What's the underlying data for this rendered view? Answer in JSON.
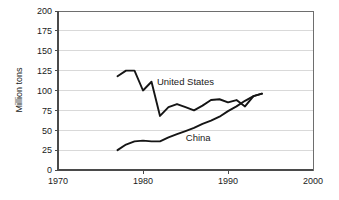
{
  "chart_data": {
    "type": "line",
    "title": "",
    "subtitle": "",
    "xlabel": "",
    "ylabel": "Million tons",
    "xlim": [
      1970,
      2000
    ],
    "ylim": [
      0,
      200
    ],
    "xticks": [
      "1970",
      "1980",
      "1990",
      "2000"
    ],
    "yticks": [
      "0",
      "25",
      "50",
      "75",
      "100",
      "125",
      "150",
      "175",
      "200"
    ],
    "grid": "horizontal",
    "legend_position": "inline-annotations",
    "annotations": [
      {
        "text": "United States",
        "x": 1985.0,
        "y": 107
      },
      {
        "text": "China",
        "x": 1986.5,
        "y": 36
      }
    ],
    "series": [
      {
        "name": "United States",
        "x": [
          1977,
          1978,
          1979,
          1980,
          1981,
          1982,
          1983,
          1984,
          1985,
          1986,
          1987,
          1988,
          1989,
          1990,
          1991,
          1992,
          1993,
          1994
        ],
        "values": [
          118,
          125,
          125,
          100,
          111,
          68,
          79,
          83,
          79,
          75,
          81,
          88,
          89,
          85,
          88,
          80,
          93,
          96
        ]
      },
      {
        "name": "China",
        "x": [
          1977,
          1978,
          1979,
          1980,
          1981,
          1982,
          1983,
          1984,
          1985,
          1986,
          1987,
          1988,
          1989,
          1990,
          1991,
          1992,
          1993,
          1994
        ],
        "values": [
          25,
          32,
          36,
          37,
          36,
          36,
          41,
          45,
          49,
          53,
          58,
          62,
          67,
          74,
          80,
          87,
          93,
          96
        ]
      }
    ]
  },
  "geometry": {
    "plot_left": 58,
    "plot_right": 313,
    "plot_top": 11,
    "plot_bottom": 170
  }
}
